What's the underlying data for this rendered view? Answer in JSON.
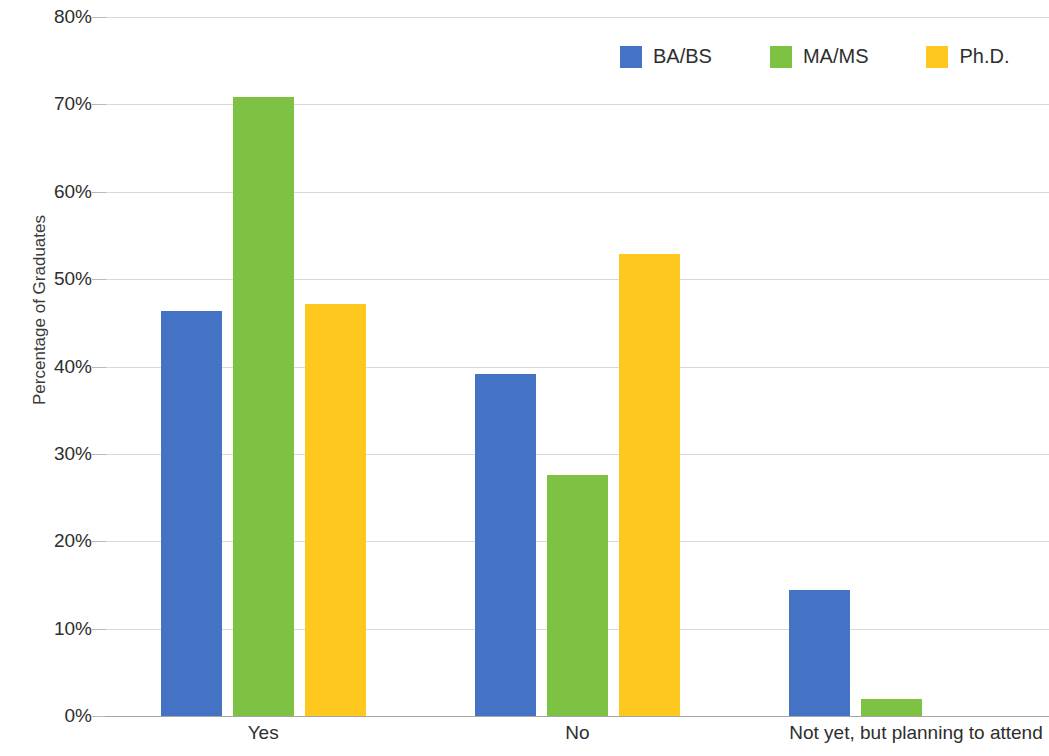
{
  "chart_data": {
    "type": "bar",
    "title": "",
    "xlabel": "",
    "ylabel": "Percentage of Graduates",
    "categories": [
      "Yes",
      "No",
      "Not yet, but planning to attend"
    ],
    "series": [
      {
        "name": "BA/BS",
        "color": "#4472C4",
        "values": [
          46.4,
          39.2,
          14.4
        ]
      },
      {
        "name": "MA/MS",
        "color": "#7DC242",
        "values": [
          70.8,
          27.6,
          1.9
        ]
      },
      {
        "name": "Ph.D.",
        "color": "#FFC81F",
        "values": [
          47.2,
          52.9,
          0
        ]
      }
    ],
    "ylim": [
      0,
      80
    ],
    "ytick_values": [
      0,
      10,
      20,
      30,
      40,
      50,
      60,
      70,
      80
    ],
    "ytick_labels": [
      "0%",
      "10%",
      "20%",
      "30%",
      "40%",
      "50%",
      "60%",
      "70%",
      "80%"
    ],
    "grid": true,
    "legend_position": "top-right"
  }
}
